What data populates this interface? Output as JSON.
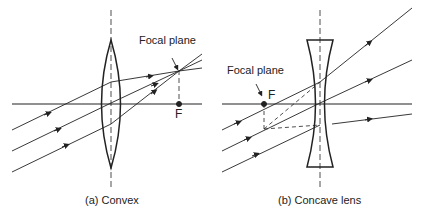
{
  "figure": {
    "panel_a": {
      "caption": "(a) Convex",
      "focal_plane_label": "Focal plane",
      "focal_point_label": "F"
    },
    "panel_b": {
      "caption": "(b) Concave lens",
      "focal_plane_label": "Focal plane",
      "focal_point_label": "F"
    }
  }
}
